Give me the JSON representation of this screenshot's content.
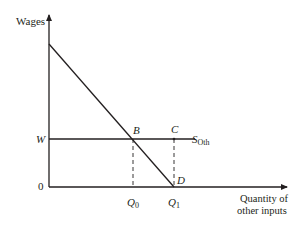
{
  "diagram": {
    "y_axis_label": "Wages",
    "x_axis_label_line1": "Quantity of",
    "x_axis_label_line2": "other inputs",
    "origin_label": "0",
    "wage_label": "W",
    "supply_label_main": "S",
    "supply_label_sub": "Oth",
    "points": {
      "B": "B",
      "C": "C",
      "D": "D"
    },
    "q0_main": "Q",
    "q0_sub": "0",
    "q1_main": "Q",
    "q1_sub": "1",
    "line_color": "#231f20"
  }
}
